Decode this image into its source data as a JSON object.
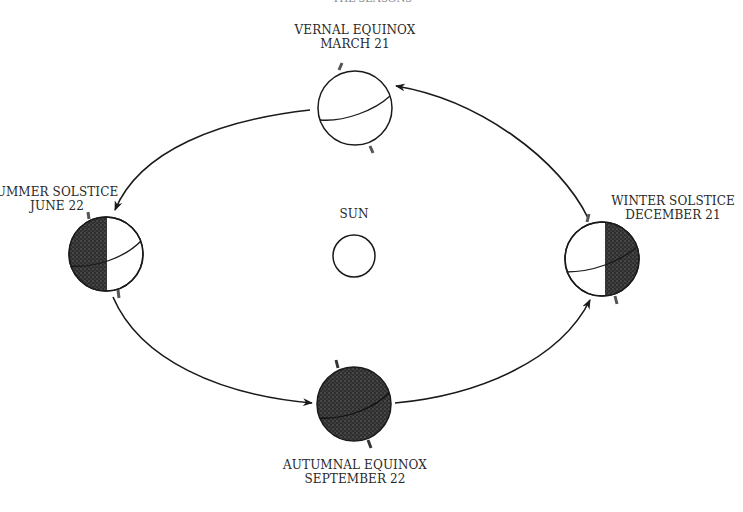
{
  "diagram": {
    "title_partial": "THE SEASONS",
    "center": {
      "label": "SUN"
    },
    "positions": [
      {
        "id": "vernal",
        "name": "VERNAL EQUINOX",
        "date": "MARCH 21",
        "shading": "none"
      },
      {
        "id": "summer",
        "name": "SUMMER SOLSTICE",
        "name_visible": "UMMER SOLSTICE",
        "date": "JUNE 22",
        "shading": "left-half"
      },
      {
        "id": "autumnal",
        "name": "AUTUMNAL EQUINOX",
        "date": "SEPTEMBER 22",
        "shading": "full"
      },
      {
        "id": "winter",
        "name": "WINTER SOLSTICE",
        "date": "DECEMBER 21",
        "shading": "right-half"
      }
    ],
    "orbit_direction": "counter-clockwise (vernal → summer → autumnal → winter → vernal)",
    "colors": {
      "ink": "#1a1a1a",
      "shade": "#3a3a3a",
      "background": "#ffffff"
    }
  }
}
